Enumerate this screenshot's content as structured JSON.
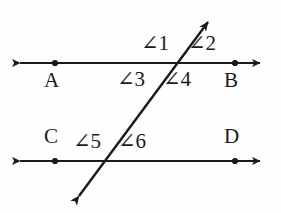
{
  "figure": {
    "type": "geometry-diagram",
    "background_color": "#fefefe",
    "stroke_color": "#1a1a1a",
    "text_color": "#1a1a1a",
    "width": 281,
    "height": 213
  },
  "lines": [
    {
      "name": "line-AB",
      "description": "upper horizontal line with arrowheads at both ends",
      "y": 63,
      "x_start": 12,
      "x_end": 268,
      "arrow_start": true,
      "arrow_end": true
    },
    {
      "name": "line-CD",
      "description": "lower horizontal line with arrowheads at both ends",
      "y": 161,
      "x_start": 12,
      "x_end": 268,
      "arrow_start": true,
      "arrow_end": true
    },
    {
      "name": "transversal",
      "description": "slanted transversal line with arrowheads at both ends",
      "x_start": 72,
      "y_start": 205,
      "x_end": 215,
      "y_end": 13,
      "arrow_start": true,
      "arrow_end": true
    }
  ],
  "points": [
    {
      "name": "point-a",
      "label": "A",
      "x": 55,
      "y": 63,
      "label_x": 44,
      "label_y": 70
    },
    {
      "name": "point-b",
      "label": "B",
      "x": 235,
      "y": 63,
      "label_x": 224,
      "label_y": 70
    },
    {
      "name": "point-c",
      "label": "C",
      "x": 55,
      "y": 161,
      "label_x": 44,
      "label_y": 126
    },
    {
      "name": "point-d",
      "label": "D",
      "x": 235,
      "y": 161,
      "label_x": 224,
      "label_y": 126
    }
  ],
  "intersections": [
    {
      "name": "intersection-upper",
      "x": 180,
      "y": 63
    },
    {
      "name": "intersection-lower",
      "x": 105,
      "y": 161
    }
  ],
  "angles": [
    {
      "name": "angle-1",
      "label": "∠1",
      "x": 141,
      "y": 33
    },
    {
      "name": "angle-2",
      "label": "∠2",
      "x": 188,
      "y": 33
    },
    {
      "name": "angle-3",
      "label": "∠3",
      "x": 117,
      "y": 69
    },
    {
      "name": "angle-4",
      "label": "∠4",
      "x": 163,
      "y": 69
    },
    {
      "name": "angle-5",
      "label": "∠5",
      "x": 73,
      "y": 131
    },
    {
      "name": "angle-6",
      "label": "∠6",
      "x": 118,
      "y": 131
    }
  ]
}
